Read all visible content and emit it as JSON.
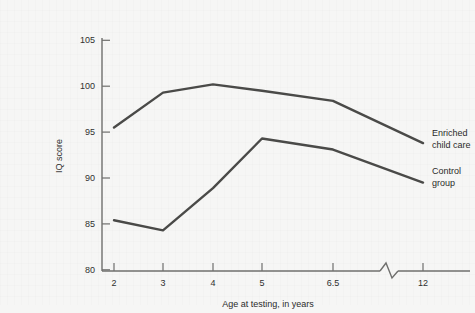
{
  "chart_data": {
    "type": "line",
    "title": "",
    "xlabel": "Age at testing, in years",
    "ylabel": "IQ score",
    "x": [
      2,
      3,
      4,
      5,
      6.5,
      12
    ],
    "categories": [
      "2",
      "3",
      "4",
      "5",
      "6.5",
      "12"
    ],
    "xtick_labels": [
      "2",
      "3",
      "4",
      "5",
      "6.5",
      "12"
    ],
    "ytick_labels": [
      "80",
      "85",
      "90",
      "95",
      "100",
      "105"
    ],
    "ylim": [
      80,
      105
    ],
    "ytick_values": [
      80,
      85,
      90,
      95,
      100,
      105
    ],
    "axis_break": true,
    "axis_break_note": "x-axis break between 6.5 and 12",
    "grid": false,
    "legend_position": "inline-right-of-line-ends",
    "series": [
      {
        "name": "Enriched child care",
        "label_line_1": "Enriched",
        "label_line_2": "child care",
        "color": "#4a4a48",
        "values": [
          95.5,
          99.3,
          100.2,
          99.5,
          98.4,
          93.8
        ]
      },
      {
        "name": "Control group",
        "label_line_1": "Control",
        "label_line_2": "group",
        "color": "#4a4a48",
        "values": [
          85.4,
          84.3,
          88.9,
          94.3,
          93.1,
          89.5
        ]
      }
    ]
  },
  "style": {
    "background": "#f6f6f5",
    "axis_color": "#6f6f6d",
    "text_color": "#2b2b2a",
    "line_color": "#4a4a48"
  }
}
